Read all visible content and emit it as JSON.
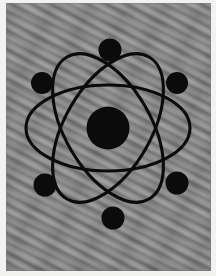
{
  "image": {
    "title": "Atom Symbol",
    "subject": "atom-diagram",
    "description": "Black atomic symbol with a central nucleus, three crossing elliptical electron orbits and six electrons, on a gray diagonally-striped textured background",
    "background_color": "#838383",
    "ink_color": "#0b0b0b",
    "page_color": "#f2f2f0",
    "texture": "diagonal-wavy-stripes",
    "canvas": {
      "width": 216,
      "height": 276
    },
    "plate": {
      "x": 6,
      "y": 3,
      "width": 205,
      "height": 268
    }
  },
  "atom": {
    "nucleus": {
      "label": "nucleus",
      "cx": 102,
      "cy": 125,
      "r": 21.5,
      "color": "#0b0b0b"
    },
    "orbits": [
      {
        "label": "orbit-1",
        "rotation": 0,
        "rx": 82,
        "ry": 43,
        "stroke_width": 3.1
      },
      {
        "label": "orbit-2",
        "rotation": 60,
        "rx": 82,
        "ry": 43,
        "stroke_width": 3.1
      },
      {
        "label": "orbit-3",
        "rotation": 120,
        "rx": 82,
        "ry": 43,
        "stroke_width": 3.1
      }
    ],
    "electrons": [
      {
        "label": "electron-top",
        "cx": 104,
        "cy": 47,
        "r": 11.5
      },
      {
        "label": "electron-upper-left",
        "cx": 36,
        "cy": 80,
        "r": 11.0
      },
      {
        "label": "electron-upper-right",
        "cx": 171,
        "cy": 80,
        "r": 11.0
      },
      {
        "label": "electron-lower-left",
        "cx": 39,
        "cy": 182,
        "r": 11.5
      },
      {
        "label": "electron-lower-right",
        "cx": 171,
        "cy": 180,
        "r": 11.5
      },
      {
        "label": "electron-bottom",
        "cx": 107,
        "cy": 215,
        "r": 11.5
      }
    ]
  }
}
